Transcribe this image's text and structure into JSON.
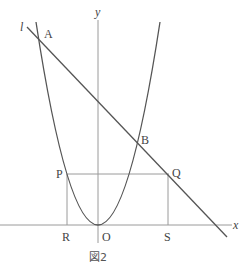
{
  "figure": {
    "caption": "図2",
    "axes": {
      "x_label": "x",
      "y_label": "y",
      "origin_label": "O"
    },
    "line_label": "l",
    "points": {
      "A": "A",
      "B": "B",
      "P": "P",
      "Q": "Q",
      "R": "R",
      "S": "S"
    },
    "colors": {
      "curve": "#555555",
      "axis": "#999999",
      "guide": "#999999",
      "text": "#444444"
    }
  }
}
